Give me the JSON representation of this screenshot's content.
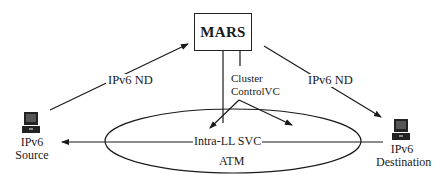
{
  "diagram": {
    "server": {
      "label": "MARS"
    },
    "links": {
      "nd_left": {
        "label": "IPv6 ND"
      },
      "nd_right": {
        "label": "IPv6 ND"
      },
      "cluster_control": {
        "line1": "Cluster",
        "line2": "ControlVC"
      },
      "intra_ll": {
        "label": "Intra-LL SVC"
      }
    },
    "network": {
      "label": "ATM"
    },
    "nodes": {
      "source": {
        "line1": "IPv6",
        "line2": "Source",
        "icon": "computer-icon"
      },
      "destination": {
        "line1": "IPv6",
        "line2": "Destination",
        "icon": "computer-icon"
      }
    },
    "colors": {
      "stroke": "#1a1a1a",
      "background": "#ffffff"
    }
  }
}
